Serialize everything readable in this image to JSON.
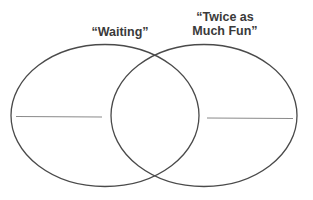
{
  "diagram": {
    "type": "venn",
    "sets": [
      {
        "label": "“Waiting”",
        "answer_line": ""
      },
      {
        "label": "“Twice as Much Fun”",
        "label_lines": [
          "“Twice as",
          "Much Fun”"
        ],
        "answer_line": ""
      }
    ],
    "colors": {
      "stroke": "#4a4a4a",
      "line": "#8a8a8a",
      "text": "#3a3a3a",
      "background": "#ffffff"
    }
  }
}
